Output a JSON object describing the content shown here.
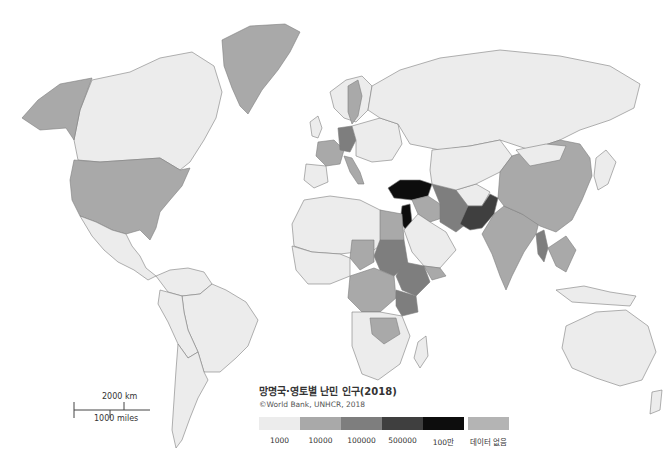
{
  "map": {
    "title": "망명국·영토별 난민 인구(2018)",
    "source": "©World Bank, UNHCR, 2018",
    "type": "choropleth",
    "colors": {
      "background": "#ffffff",
      "border": "#7d7d7d",
      "c1000": "#ececec",
      "c10000": "#a9a9a9",
      "c100000": "#7e7e7e",
      "c500000": "#3f3f3f",
      "c1000000": "#0d0d0d",
      "no_data": "#b4b4b4"
    }
  },
  "legend": {
    "items": [
      {
        "label": "1000",
        "color": "#ececec"
      },
      {
        "label": "10000",
        "color": "#a9a9a9"
      },
      {
        "label": "100000",
        "color": "#7e7e7e"
      },
      {
        "label": "500000",
        "color": "#3f3f3f"
      },
      {
        "label": "100만",
        "color": "#0d0d0d"
      }
    ],
    "no_data": {
      "label": "데이터 없음",
      "color": "#b4b4b4"
    }
  },
  "scale_bar": {
    "km_label": "2000 km",
    "miles_label": "1000 miles"
  }
}
